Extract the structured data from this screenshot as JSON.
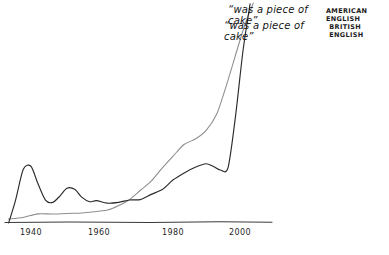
{
  "chart_data": {
    "type": "line",
    "title": "",
    "subtitle": "",
    "xlabel": "",
    "ylabel": "",
    "xlim": [
      1935,
      2008
    ],
    "ylim": [
      0,
      1.08
    ],
    "grid": false,
    "legend_position": "top-right",
    "style": "hand-drawn",
    "xticks": [
      1940,
      1960,
      1980,
      2000
    ],
    "xtick_labels": [
      "1940",
      "1960",
      "1980",
      "2000"
    ],
    "annotations": [
      {
        "phrase": "“was a piece of cake”",
        "corpus": "AMERICAN ENGLISH"
      },
      {
        "phrase": "“was a piece of cake”",
        "corpus": "BRITISH ENGLISH"
      }
    ],
    "series": [
      {
        "name": "AMERICAN ENGLISH",
        "label": "“was a piece of cake”",
        "color": "#8d8d8d",
        "x": [
          1936,
          1940,
          1944,
          1948,
          1952,
          1956,
          1960,
          1963,
          1966,
          1969,
          1972,
          1975,
          1978,
          1981,
          1984,
          1987,
          1990,
          1993,
          1996,
          1999,
          2001,
          2003
        ],
        "y": [
          0.01,
          0.02,
          0.035,
          0.04,
          0.04,
          0.045,
          0.05,
          0.06,
          0.08,
          0.11,
          0.15,
          0.2,
          0.26,
          0.32,
          0.37,
          0.4,
          0.44,
          0.52,
          0.68,
          0.85,
          0.97,
          1.05
        ]
      },
      {
        "name": "BRITISH ENGLISH",
        "label": "“was a piece of cake”",
        "color": "#2b2b2b",
        "x": [
          1936,
          1938,
          1940,
          1942,
          1944,
          1946,
          1948,
          1950,
          1952,
          1954,
          1956,
          1958,
          1960,
          1963,
          1966,
          1969,
          1972,
          1975,
          1978,
          1981,
          1984,
          1987,
          1990,
          1992,
          1994,
          1996,
          1998,
          2000,
          2002
        ],
        "y": [
          0.0,
          0.1,
          0.25,
          0.27,
          0.18,
          0.1,
          0.09,
          0.13,
          0.16,
          0.155,
          0.12,
          0.1,
          0.1,
          0.095,
          0.09,
          0.1,
          0.11,
          0.13,
          0.16,
          0.2,
          0.24,
          0.26,
          0.28,
          0.27,
          0.25,
          0.26,
          0.5,
          0.82,
          1.04
        ]
      }
    ]
  },
  "axis": {
    "line_color": "#3a3a3a"
  }
}
